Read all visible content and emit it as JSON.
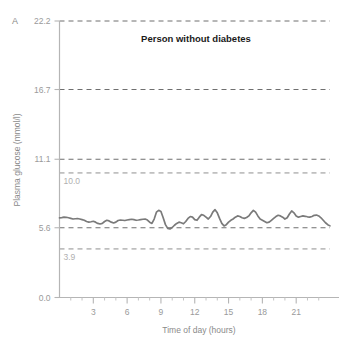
{
  "figure": {
    "panel_letter": "A",
    "title": "Person without diabetes",
    "background_color": "#ffffff"
  },
  "chart_data": {
    "type": "line",
    "title": "Person without diabetes",
    "xlabel": "Time of day (hours)",
    "ylabel": "Plasma glucose (mmol/l)",
    "xlim": [
      0,
      24
    ],
    "ylim": [
      0,
      22.2
    ],
    "grid": true,
    "grid_style": "dashed-horizontal",
    "legend": "none",
    "line_color": "#7a7a7a",
    "axis_color": "#b5b5b5",
    "tick_label_color": "#9a9a9a",
    "band_label_color": "#b0b0b0",
    "y_ticks": [
      0.0,
      5.6,
      11.1,
      16.7,
      22.2
    ],
    "y_tick_labels": [
      "0.0",
      "5.6",
      "11.1",
      "16.7",
      "22.2"
    ],
    "x_ticks": [
      3,
      6,
      9,
      12,
      15,
      18,
      21
    ],
    "x_tick_labels": [
      "3",
      "6",
      "9",
      "12",
      "15",
      "18",
      "21"
    ],
    "x_minor_tick_interval": 1,
    "reference_lines": [
      {
        "value": 10.0,
        "label": "10.0",
        "label_position": "below-right-of-axis"
      },
      {
        "value": 3.9,
        "label": "3.9",
        "label_position": "below-right-of-axis"
      }
    ],
    "series": [
      {
        "name": "Plasma glucose",
        "color": "#7a7a7a",
        "x": [
          0.0,
          0.2,
          0.4,
          0.6,
          0.8,
          1.0,
          1.2,
          1.4,
          1.6,
          1.8,
          2.0,
          2.2,
          2.4,
          2.6,
          2.8,
          3.0,
          3.2,
          3.4,
          3.6,
          3.8,
          4.0,
          4.2,
          4.4,
          4.6,
          4.8,
          5.0,
          5.2,
          5.4,
          5.6,
          5.8,
          6.0,
          6.2,
          6.4,
          6.6,
          6.8,
          7.0,
          7.2,
          7.4,
          7.6,
          7.8,
          8.0,
          8.2,
          8.4,
          8.6,
          8.8,
          9.0,
          9.2,
          9.4,
          9.6,
          9.8,
          10.0,
          10.2,
          10.4,
          10.6,
          10.8,
          11.0,
          11.2,
          11.4,
          11.6,
          11.8,
          12.0,
          12.2,
          12.4,
          12.6,
          12.8,
          13.0,
          13.2,
          13.4,
          13.6,
          13.8,
          14.0,
          14.2,
          14.4,
          14.6,
          14.8,
          15.0,
          15.2,
          15.4,
          15.6,
          15.8,
          16.0,
          16.2,
          16.4,
          16.6,
          16.8,
          17.0,
          17.2,
          17.4,
          17.6,
          17.8,
          18.0,
          18.2,
          18.4,
          18.6,
          18.8,
          19.0,
          19.2,
          19.4,
          19.6,
          19.8,
          20.0,
          20.2,
          20.4,
          20.6,
          20.8,
          21.0,
          21.2,
          21.4,
          21.6,
          21.8,
          22.0,
          22.2,
          22.4,
          22.6,
          22.8,
          23.0,
          23.2,
          23.4,
          23.6,
          23.8,
          24.0
        ],
        "y": [
          6.4,
          6.42,
          6.45,
          6.44,
          6.4,
          6.35,
          6.3,
          6.32,
          6.34,
          6.3,
          6.25,
          6.2,
          6.1,
          6.05,
          6.08,
          6.12,
          6.05,
          5.95,
          5.9,
          5.95,
          6.1,
          6.2,
          6.15,
          6.05,
          5.98,
          6.05,
          6.18,
          6.22,
          6.2,
          6.18,
          6.22,
          6.25,
          6.28,
          6.25,
          6.2,
          6.22,
          6.25,
          6.28,
          6.3,
          6.22,
          6.05,
          5.95,
          6.3,
          6.85,
          7.0,
          6.9,
          6.4,
          5.85,
          5.55,
          5.5,
          5.62,
          5.8,
          5.95,
          6.05,
          6.0,
          5.92,
          6.1,
          6.35,
          6.5,
          6.45,
          6.25,
          6.2,
          6.45,
          6.65,
          6.6,
          6.45,
          6.3,
          6.5,
          6.85,
          7.05,
          6.8,
          6.35,
          5.95,
          5.75,
          5.85,
          6.05,
          6.2,
          6.3,
          6.45,
          6.55,
          6.5,
          6.4,
          6.35,
          6.42,
          6.55,
          6.8,
          7.0,
          6.85,
          6.55,
          6.3,
          6.2,
          6.1,
          6.0,
          6.05,
          6.2,
          6.35,
          6.5,
          6.6,
          6.55,
          6.45,
          6.3,
          6.4,
          6.7,
          6.95,
          6.8,
          6.55,
          6.45,
          6.5,
          6.55,
          6.52,
          6.48,
          6.45,
          6.5,
          6.6,
          6.62,
          6.55,
          6.4,
          6.2,
          6.0,
          5.85,
          5.75
        ]
      }
    ]
  }
}
